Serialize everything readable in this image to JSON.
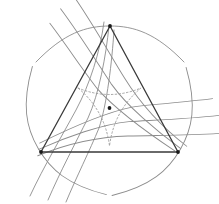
{
  "figure": {
    "canvas": {
      "width": 219,
      "height": 204,
      "background": "#ffffff"
    },
    "colors": {
      "triangle_stroke": "#3a3a3a",
      "curve_stroke": "#8c8c8c",
      "dotted_stroke": "#9a9a9a",
      "vertex_dot": "#1a1a1a",
      "center_dot": "#1a1a1a",
      "background": "#ffffff"
    },
    "strokes": {
      "triangle_width": 1.3,
      "curve_width": 0.9,
      "dotted_width": 0.9,
      "dash_pattern": "1.6 2.2"
    },
    "center": {
      "x": 109.5,
      "y": 108.0,
      "dot_radius": 1.9
    },
    "triangle": {
      "vertices": [
        {
          "name": "apex",
          "x": 110.0,
          "y": 26.0,
          "dot_radius": 1.9
        },
        {
          "name": "bottom-right",
          "x": 178.0,
          "y": 152.0,
          "dot_radius": 1.9
        },
        {
          "name": "bottom-left",
          "x": 41.0,
          "y": 152.0,
          "dot_radius": 1.9
        }
      ],
      "side_length": 137.0,
      "rotation_degrees": 0
    },
    "inner_deltoid": {
      "style": "dotted",
      "cusps": [
        {
          "x": 78.0,
          "y": 88.0
        },
        {
          "x": 141.0,
          "y": 88.0
        },
        {
          "x": 109.5,
          "y": 146.0
        }
      ],
      "orientation": "inverted relative to triangle",
      "arc_bulge": 13.0
    },
    "curve_families": {
      "count": 3,
      "rotation_step_degrees": 120,
      "per_family": 3,
      "description": "Each family consists of three nested hyperbola-like branches tangent near a triangle vertex and sweeping outward beyond the triangle sides."
    },
    "tangent_arcs": {
      "count": 3,
      "description": "One arc passes through each triangle vertex, tangent to the opposite curve family."
    }
  },
  "chart_data": {
    "type": "line",
    "xlabel": "",
    "ylabel": "",
    "xlim": [
      0,
      219
    ],
    "ylim": [
      204,
      0
    ],
    "grid": false,
    "legend": null,
    "annotations": [
      {
        "label": "center point",
        "x": 109.5,
        "y": 108.0
      },
      {
        "label": "apex vertex",
        "x": 110.0,
        "y": 26.0
      },
      {
        "label": "bottom-left vertex",
        "x": 41.0,
        "y": 152.0
      },
      {
        "label": "bottom-right vertex",
        "x": 178.0,
        "y": 152.0
      }
    ],
    "series": [
      {
        "name": "triangle",
        "style": "solid",
        "color": "#3a3a3a",
        "closed": true,
        "points": [
          [
            110,
            26
          ],
          [
            178,
            152
          ],
          [
            41,
            152
          ]
        ]
      },
      {
        "name": "inner-deltoid",
        "style": "dotted",
        "color": "#9a9a9a",
        "closed": true,
        "points": [
          [
            78,
            88
          ],
          [
            141,
            88
          ],
          [
            109.5,
            146
          ]
        ],
        "bulge": 13.0
      },
      {
        "name": "curve-family-1",
        "style": "solid",
        "color": "#8c8c8c",
        "branches": 3,
        "rotation": 0
      },
      {
        "name": "curve-family-2",
        "style": "solid",
        "color": "#8c8c8c",
        "branches": 3,
        "rotation": 120
      },
      {
        "name": "curve-family-3",
        "style": "solid",
        "color": "#8c8c8c",
        "branches": 3,
        "rotation": 240
      }
    ]
  }
}
